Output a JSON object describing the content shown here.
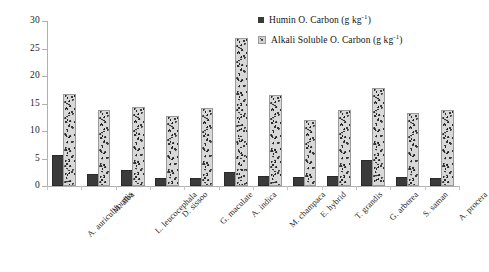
{
  "chart_data": {
    "type": "bar",
    "title": "",
    "xlabel": "",
    "ylabel": "",
    "ylim": [
      0,
      30
    ],
    "yticks": [
      0,
      5,
      10,
      15,
      20,
      25,
      30
    ],
    "grid": false,
    "legend_position": "top-right",
    "categories": [
      "A. auriculiformis",
      "M. alba",
      "L. leucocephala",
      "D. sissoo",
      "G. maculate",
      "A. indica",
      "M. champaca",
      "E. hybrid",
      "T. grandis",
      "G. arborea",
      "S. saman",
      "A. procera"
    ],
    "series": [
      {
        "name": "Humin O. Carbon (g kg",
        "name_sup": "-1",
        "name_tail": ")",
        "full_name": "Humin O. Carbon (g kg-1)",
        "color": "#3a3a3a",
        "values": [
          5.2,
          1.9,
          2.5,
          1.1,
          1.1,
          2.1,
          1.4,
          1.2,
          1.4,
          4.4,
          1.2,
          1.1
        ]
      },
      {
        "name": "Alkali Soluble O. Carbon (g kg",
        "name_sup": "-1",
        "name_tail": ")",
        "full_name": "Alkali Soluble O. Carbon (g kg-1)",
        "color": "#d8d8d8",
        "values": [
          16.3,
          13.5,
          14.0,
          12.3,
          13.8,
          26.5,
          16.1,
          11.6,
          13.5,
          17.4,
          13.0,
          13.5
        ]
      }
    ]
  },
  "axis": {
    "y_tick_labels": [
      "0",
      "5",
      "10",
      "15",
      "20",
      "25",
      "30"
    ]
  },
  "legend": {
    "items": [
      {
        "label_main": "Humin O. Carbon (g kg",
        "label_sup": "-1",
        "label_end": ")",
        "marker": "humin"
      },
      {
        "label_main": "Alkali Soluble O. Carbon (g kg",
        "label_sup": "-1",
        "label_end": ")",
        "marker": "alkali"
      }
    ]
  }
}
